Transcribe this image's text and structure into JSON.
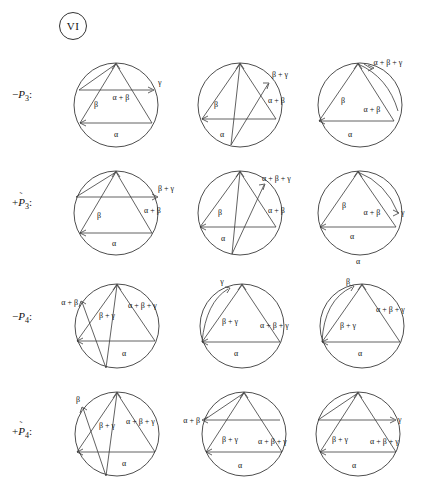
{
  "figure": {
    "marker_label": "VI",
    "greek": {
      "alpha": "α",
      "beta": "β",
      "gamma": "γ"
    }
  },
  "rows": [
    {
      "id": "row-minus-p3",
      "label": {
        "sign": "−",
        "symbol": "P",
        "overbar": "",
        "subscript": "3",
        "colon": ":"
      },
      "diagrams": [
        {
          "id": "d-r1-c1",
          "labels": [
            {
              "text": "γ",
              "x": 92,
              "y": 30
            },
            {
              "text": "α + β",
              "x": 55,
              "y": 45
            },
            {
              "text": "β",
              "x": 30,
              "y": 52
            },
            {
              "text": "α",
              "x": 50,
              "y": 82
            }
          ]
        },
        {
          "id": "d-r1-c2",
          "labels": [
            {
              "text": "β + γ",
              "x": 82,
              "y": 22
            },
            {
              "text": "α + β",
              "x": 78,
              "y": 48
            },
            {
              "text": "β",
              "x": 26,
              "y": 52
            },
            {
              "text": "α",
              "x": 32,
              "y": 82
            }
          ]
        },
        {
          "id": "d-r1-c3",
          "labels": [
            {
              "text": "α + β + γ",
              "x": 78,
              "y": 10
            },
            {
              "text": "α + β",
              "x": 62,
              "y": 57
            },
            {
              "text": "β",
              "x": 33,
              "y": 48
            },
            {
              "text": "α",
              "x": 40,
              "y": 82
            }
          ]
        }
      ]
    },
    {
      "id": "row-plus-p3t",
      "label": {
        "sign": "+",
        "symbol": "P",
        "overbar": "˜",
        "subscript": "3",
        "colon": ":"
      },
      "diagrams": [
        {
          "id": "d-r2-c1",
          "labels": [
            {
              "text": "β + γ",
              "x": 92,
              "y": 28
            },
            {
              "text": "α + β",
              "x": 85,
              "y": 48
            },
            {
              "text": "β",
              "x": 33,
              "y": 55
            },
            {
              "text": "α",
              "x": 48,
              "y": 83
            }
          ]
        },
        {
          "id": "d-r2-c2",
          "labels": [
            {
              "text": "α + β + γ",
              "x": 80,
              "y": 18
            },
            {
              "text": "α + β",
              "x": 82,
              "y": 50
            },
            {
              "text": "β",
              "x": 30,
              "y": 52
            },
            {
              "text": "α",
              "x": 33,
              "y": 78
            }
          ]
        },
        {
          "id": "d-r2-c3",
          "labels": [
            {
              "text": "γ",
              "x": 95,
              "y": 52
            },
            {
              "text": "α + β",
              "x": 62,
              "y": 52
            },
            {
              "text": "β",
              "x": 34,
              "y": 45
            },
            {
              "text": "α",
              "x": 42,
              "y": 76
            },
            {
              "text": "α",
              "x": 48,
              "y": 96
            }
          ]
        }
      ]
    },
    {
      "id": "row-minus-p4",
      "label": {
        "sign": "−",
        "symbol": "P",
        "overbar": "",
        "subscript": "4",
        "colon": ":"
      },
      "diagrams": [
        {
          "id": "d-r3-c1",
          "labels": [
            {
              "text": "α + β",
              "x": -2,
              "y": 30
            },
            {
              "text": "β + γ",
              "x": 44,
              "y": 42
            },
            {
              "text": "α + β + γ",
              "x": 72,
              "y": 32
            },
            {
              "text": "α",
              "x": 58,
              "y": 80
            }
          ]
        },
        {
          "id": "d-r3-c2",
          "labels": [
            {
              "text": "γ",
              "x": 30,
              "y": 10
            },
            {
              "text": "β + γ",
              "x": 38,
              "y": 48
            },
            {
              "text": "α + β + γ",
              "x": 76,
              "y": 52
            },
            {
              "text": "α",
              "x": 44,
              "y": 80
            }
          ]
        },
        {
          "id": "d-r3-c3",
          "labels": [
            {
              "text": "β",
              "x": 36,
              "y": 10
            },
            {
              "text": "β + γ",
              "x": 36,
              "y": 52
            },
            {
              "text": "α + β + γ",
              "x": 74,
              "y": 36
            },
            {
              "text": "α",
              "x": 48,
              "y": 80
            }
          ]
        }
      ]
    },
    {
      "id": "row-plus-p4t",
      "label": {
        "sign": "+",
        "symbol": "P",
        "overbar": "˜",
        "subscript": "4",
        "colon": ":"
      },
      "diagrams": [
        {
          "id": "d-r4-c1",
          "labels": [
            {
              "text": "β",
              "x": 12,
              "y": 16
            },
            {
              "text": "β + γ",
              "x": 44,
              "y": 42
            },
            {
              "text": "α + β + γ",
              "x": 72,
              "y": 38
            },
            {
              "text": "α",
              "x": 58,
              "y": 80
            }
          ]
        },
        {
          "id": "d-r4-c2",
          "labels": [
            {
              "text": "α + β",
              "x": -8,
              "y": 38
            },
            {
              "text": "β + γ",
              "x": 38,
              "y": 56
            },
            {
              "text": "α + β + γ",
              "x": 74,
              "y": 58
            },
            {
              "text": "α",
              "x": 48,
              "y": 82
            }
          ]
        },
        {
          "id": "d-r4-c3",
          "labels": [
            {
              "text": "γ",
              "x": 94,
              "y": 36
            },
            {
              "text": "β + γ",
              "x": 30,
              "y": 56
            },
            {
              "text": "α + β + γ",
              "x": 70,
              "y": 58
            },
            {
              "text": "α",
              "x": 46,
              "y": 82
            }
          ]
        }
      ]
    }
  ]
}
